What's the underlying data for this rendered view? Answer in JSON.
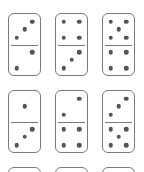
{
  "colors": {
    "border": "#7a7a7a",
    "pip": "#555555",
    "background": "#ffffff"
  },
  "dominoes": [
    {
      "top": 3,
      "bottom": 2,
      "x": 8,
      "y": 13
    },
    {
      "top": 4,
      "bottom": 3,
      "x": 55,
      "y": 13
    },
    {
      "top": 5,
      "bottom": 4,
      "x": 102,
      "y": 13
    },
    {
      "top": 1,
      "bottom": 3,
      "x": 8,
      "y": 90
    },
    {
      "top": 2,
      "bottom": 4,
      "x": 55,
      "y": 90
    },
    {
      "top": 3,
      "bottom": 5,
      "x": 102,
      "y": 90
    },
    {
      "top": null,
      "bottom": null,
      "x": 8,
      "y": 167
    },
    {
      "top": null,
      "bottom": null,
      "x": 55,
      "y": 167
    },
    {
      "top": null,
      "bottom": null,
      "x": 102,
      "y": 167
    }
  ]
}
